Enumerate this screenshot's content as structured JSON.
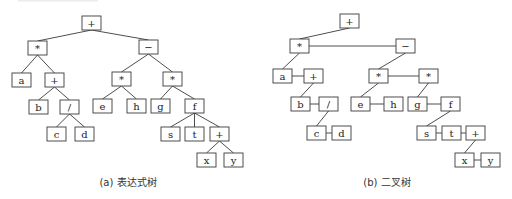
{
  "figure": {
    "box_width": 19,
    "box_height": 14,
    "colors": {
      "stroke": "#3a3a3a",
      "text": "#222222",
      "background": "#ffffff"
    }
  },
  "panels": [
    {
      "id": "expression-tree",
      "caption": "(a) 表达式树",
      "caption_pos": {
        "x": 128,
        "y": 186
      },
      "nodes": [
        {
          "id": "n1",
          "label": "+",
          "x": 82,
          "y": 16
        },
        {
          "id": "n2",
          "label": "*",
          "x": 28,
          "y": 41
        },
        {
          "id": "n3",
          "label": "−",
          "x": 139,
          "y": 40
        },
        {
          "id": "n4",
          "label": "a",
          "x": 12,
          "y": 73
        },
        {
          "id": "n5",
          "label": "+",
          "x": 45,
          "y": 73
        },
        {
          "id": "n6",
          "label": "*",
          "x": 112,
          "y": 72
        },
        {
          "id": "n7",
          "label": "*",
          "x": 163,
          "y": 72
        },
        {
          "id": "n8",
          "label": "b",
          "x": 29,
          "y": 100
        },
        {
          "id": "n9",
          "label": "/",
          "x": 60,
          "y": 100
        },
        {
          "id": "n10",
          "label": "e",
          "x": 93,
          "y": 99
        },
        {
          "id": "n11",
          "label": "h",
          "x": 127,
          "y": 99
        },
        {
          "id": "n12",
          "label": "g",
          "x": 151,
          "y": 99
        },
        {
          "id": "n13",
          "label": "f",
          "x": 185,
          "y": 99
        },
        {
          "id": "n14",
          "label": "c",
          "x": 47,
          "y": 127
        },
        {
          "id": "n15",
          "label": "d",
          "x": 75,
          "y": 127
        },
        {
          "id": "n16",
          "label": "s",
          "x": 161,
          "y": 127
        },
        {
          "id": "n17",
          "label": "t",
          "x": 185,
          "y": 127
        },
        {
          "id": "n18",
          "label": "+",
          "x": 210,
          "y": 127
        },
        {
          "id": "n19",
          "label": "x",
          "x": 197,
          "y": 153
        },
        {
          "id": "n20",
          "label": "y",
          "x": 224,
          "y": 153
        }
      ],
      "edges": [
        [
          "n1",
          "n2"
        ],
        [
          "n1",
          "n3"
        ],
        [
          "n2",
          "n4"
        ],
        [
          "n2",
          "n5"
        ],
        [
          "n3",
          "n6"
        ],
        [
          "n3",
          "n7"
        ],
        [
          "n5",
          "n8"
        ],
        [
          "n5",
          "n9"
        ],
        [
          "n6",
          "n10"
        ],
        [
          "n6",
          "n11"
        ],
        [
          "n7",
          "n12"
        ],
        [
          "n7",
          "n13"
        ],
        [
          "n9",
          "n14"
        ],
        [
          "n9",
          "n15"
        ],
        [
          "n13",
          "n16"
        ],
        [
          "n13",
          "n17"
        ],
        [
          "n13",
          "n18"
        ],
        [
          "n18",
          "n19"
        ],
        [
          "n18",
          "n20"
        ]
      ],
      "edge_style": "tree"
    },
    {
      "id": "binary-tree",
      "caption": "(b) 二叉树",
      "caption_pos": {
        "x": 387,
        "y": 186
      },
      "nodes": [
        {
          "id": "m1",
          "label": "+",
          "x": 340,
          "y": 14
        },
        {
          "id": "m2",
          "label": "*",
          "x": 290,
          "y": 39
        },
        {
          "id": "m3",
          "label": "−",
          "x": 396,
          "y": 39
        },
        {
          "id": "m4",
          "label": "a",
          "x": 273,
          "y": 69
        },
        {
          "id": "m5",
          "label": "+",
          "x": 304,
          "y": 69
        },
        {
          "id": "m6",
          "label": "*",
          "x": 369,
          "y": 69
        },
        {
          "id": "m7",
          "label": "*",
          "x": 419,
          "y": 69
        },
        {
          "id": "m8",
          "label": "b",
          "x": 291,
          "y": 97
        },
        {
          "id": "m9",
          "label": "/",
          "x": 319,
          "y": 97
        },
        {
          "id": "m10",
          "label": "e",
          "x": 351,
          "y": 97
        },
        {
          "id": "m11",
          "label": "h",
          "x": 384,
          "y": 97
        },
        {
          "id": "m12",
          "label": "g",
          "x": 408,
          "y": 97
        },
        {
          "id": "m13",
          "label": "f",
          "x": 441,
          "y": 97
        },
        {
          "id": "m14",
          "label": "c",
          "x": 307,
          "y": 126
        },
        {
          "id": "m15",
          "label": "d",
          "x": 332,
          "y": 126
        },
        {
          "id": "m16",
          "label": "s",
          "x": 417,
          "y": 126
        },
        {
          "id": "m17",
          "label": "t",
          "x": 442,
          "y": 126
        },
        {
          "id": "m18",
          "label": "+",
          "x": 466,
          "y": 126
        },
        {
          "id": "m19",
          "label": "x",
          "x": 455,
          "y": 153
        },
        {
          "id": "m20",
          "label": "y",
          "x": 481,
          "y": 153
        }
      ],
      "child_edges": [
        [
          "m1",
          "m2"
        ],
        [
          "m2",
          "m4"
        ],
        [
          "m5",
          "m8"
        ],
        [
          "m9",
          "m14"
        ],
        [
          "m3",
          "m6"
        ],
        [
          "m6",
          "m10"
        ],
        [
          "m7",
          "m12"
        ],
        [
          "m13",
          "m16"
        ],
        [
          "m18",
          "m19"
        ]
      ],
      "sibling_edges": [
        [
          "m2",
          "m3"
        ],
        [
          "m4",
          "m5"
        ],
        [
          "m8",
          "m9"
        ],
        [
          "m14",
          "m15"
        ],
        [
          "m6",
          "m7"
        ],
        [
          "m10",
          "m11"
        ],
        [
          "m12",
          "m13"
        ],
        [
          "m16",
          "m17"
        ],
        [
          "m17",
          "m18"
        ],
        [
          "m19",
          "m20"
        ]
      ],
      "edge_style": "left-child-right-sibling"
    }
  ]
}
